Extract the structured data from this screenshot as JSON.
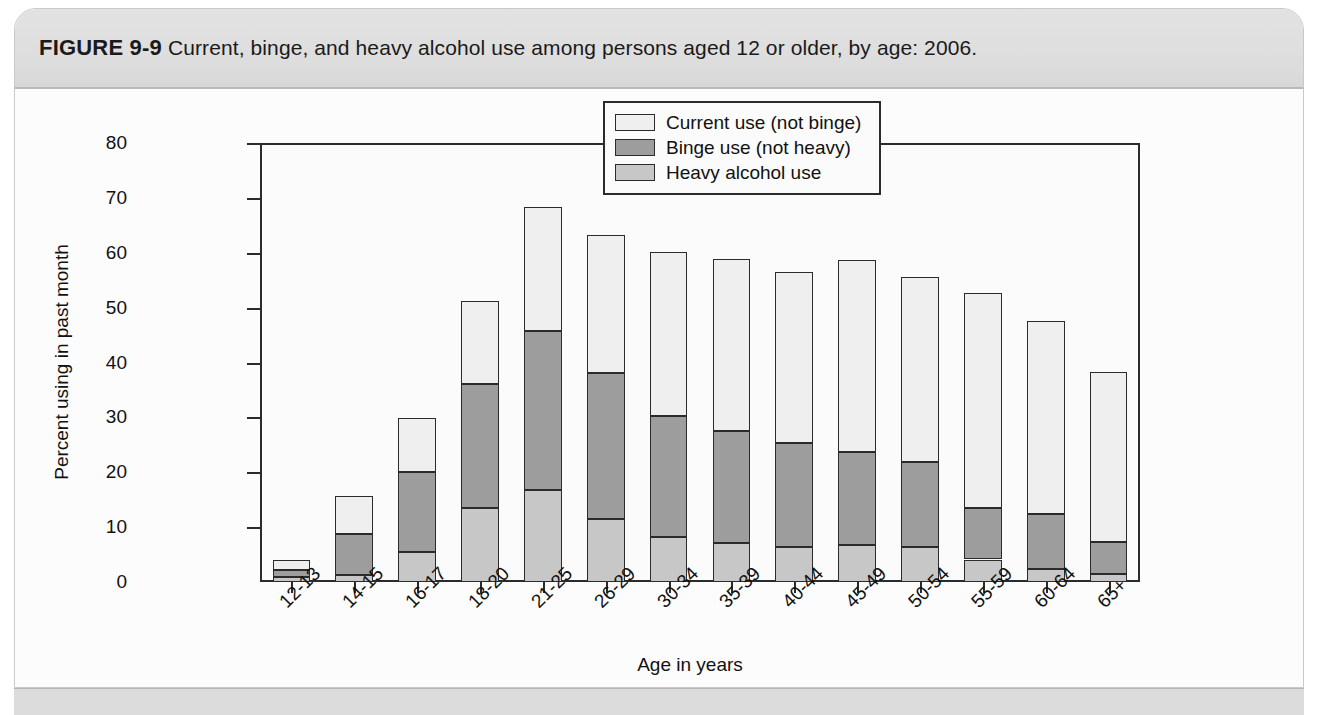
{
  "figure": {
    "label": "FIGURE 9-9",
    "caption": "Current, binge, and heavy alcohol use among persons aged 12 or older, by age: 2006."
  },
  "chart_data": {
    "type": "bar",
    "subtype": "stacked-vertical",
    "title": "Current, binge, and heavy alcohol use among persons aged 12 or older, by age: 2006.",
    "xlabel": "Age in years",
    "ylabel": "Percent using in past month",
    "ylim": [
      0,
      80
    ],
    "yticks": [
      0,
      10,
      20,
      30,
      40,
      50,
      60,
      70,
      80
    ],
    "ytick_labels": [
      "0",
      "10",
      "20",
      "30",
      "40",
      "50",
      "60",
      "70",
      "80"
    ],
    "grid": false,
    "legend_position": "top-right",
    "categories": [
      "12-13",
      "14-15",
      "16-17",
      "18-20",
      "21-25",
      "26-29",
      "30-34",
      "35-39",
      "40-44",
      "45-49",
      "50-54",
      "55-59",
      "60-64",
      "65+"
    ],
    "series": [
      {
        "name": "Heavy alcohol use",
        "color": "#c7c7c7",
        "values": [
          1.0,
          1.2,
          5.5,
          13.5,
          16.7,
          11.4,
          8.2,
          7.1,
          6.3,
          6.8,
          6.3,
          4.1,
          2.4,
          1.4
        ]
      },
      {
        "name": "Binge use (not heavy)",
        "color": "#9d9d9d",
        "values": [
          1.2,
          7.5,
          14.5,
          22.6,
          29.1,
          26.7,
          22.1,
          20.4,
          19.1,
          16.8,
          15.6,
          9.4,
          10.0,
          5.8
        ]
      },
      {
        "name": "Current use (not binge)",
        "color": "#efefef",
        "values": [
          1.8,
          6.9,
          9.8,
          15.1,
          22.5,
          25.2,
          29.9,
          31.4,
          31.1,
          35.0,
          33.7,
          39.2,
          35.1,
          31.1
        ]
      }
    ],
    "cumulative_totals": [
      4.0,
      15.6,
      29.8,
      51.2,
      68.3,
      63.3,
      60.2,
      58.9,
      56.5,
      58.6,
      55.6,
      52.7,
      47.5,
      38.3
    ],
    "annotations": []
  },
  "legend": {
    "entries": [
      {
        "label": "Current use (not binge)",
        "color": "#efefef"
      },
      {
        "label": "Binge use (not heavy)",
        "color": "#9d9d9d"
      },
      {
        "label": "Heavy alcohol use",
        "color": "#c7c7c7"
      }
    ]
  }
}
